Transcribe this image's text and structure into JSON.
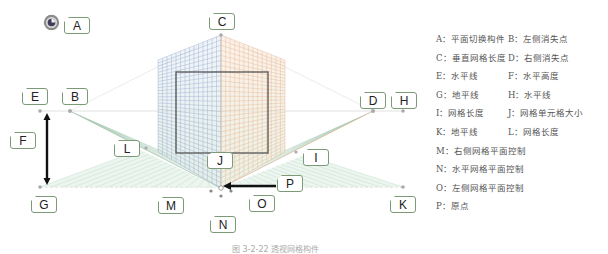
{
  "diagram": {
    "callouts": [
      {
        "id": "A",
        "label": "A",
        "x": 64,
        "y": 17
      },
      {
        "id": "B",
        "label": "B",
        "x": 62,
        "y": 88
      },
      {
        "id": "C",
        "label": "C",
        "x": 209,
        "y": 13
      },
      {
        "id": "D",
        "label": "D",
        "x": 360,
        "y": 92
      },
      {
        "id": "E",
        "label": "E",
        "x": 22,
        "y": 88
      },
      {
        "id": "F",
        "label": "F",
        "x": 10,
        "y": 132
      },
      {
        "id": "G",
        "label": "G",
        "x": 31,
        "y": 196
      },
      {
        "id": "H",
        "label": "H",
        "x": 391,
        "y": 92
      },
      {
        "id": "I",
        "label": "I",
        "x": 303,
        "y": 149
      },
      {
        "id": "J",
        "label": "J",
        "x": 207,
        "y": 152
      },
      {
        "id": "K",
        "label": "K",
        "x": 390,
        "y": 196
      },
      {
        "id": "L",
        "label": "L",
        "x": 114,
        "y": 140
      },
      {
        "id": "M",
        "label": "M",
        "x": 158,
        "y": 197
      },
      {
        "id": "N",
        "label": "N",
        "x": 210,
        "y": 216
      },
      {
        "id": "O",
        "label": "O",
        "x": 249,
        "y": 195
      },
      {
        "id": "P",
        "label": "P",
        "x": 277,
        "y": 175
      }
    ],
    "colors": {
      "left_grid": "#8fa6cc",
      "right_grid": "#e8b48a",
      "ground_grid": "#8fbf9f",
      "callout_border": "#7c9a78",
      "frame": "#555555",
      "arrow": "#111111"
    }
  },
  "legend": {
    "rows": [
      [
        "A：平面切换构件",
        "B：左侧消失点"
      ],
      [
        "C：垂直网格长度",
        "D：右侧消失点"
      ],
      [
        "E：水平线",
        "F：水平高度"
      ],
      [
        "G：地平线",
        "H：水平线"
      ],
      [
        "I：网格长度",
        "J：网格单元格大小"
      ],
      [
        "K：地平线",
        "L：网格长度"
      ],
      [
        "M：右侧网格平面控制",
        ""
      ],
      [
        "N：水平网格平面控制",
        ""
      ],
      [
        "O：左侧网格平面控制",
        ""
      ],
      [
        "P：原点",
        ""
      ]
    ]
  },
  "caption": "图 3-2-22  透视网格构件"
}
